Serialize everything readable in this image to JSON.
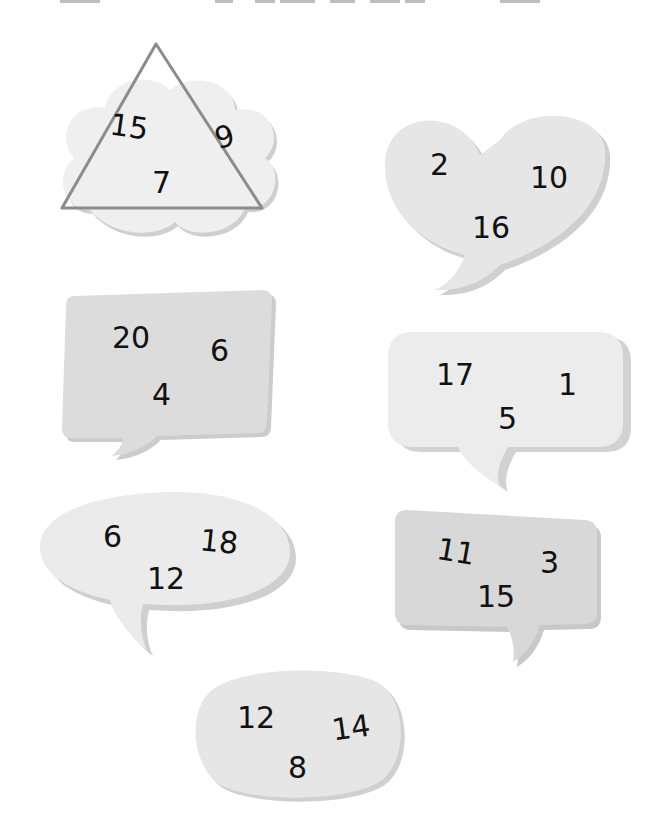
{
  "colors": {
    "bubble_fill_light": "#eeeeee",
    "bubble_fill_mid": "#e4e4e4",
    "bubble_fill_dark": "#d9d9d9",
    "bubble_shadow": "#cfcfcf",
    "triangle_stroke": "#8c8c8c",
    "digit": "#111111"
  },
  "shapes": [
    {
      "id": "cloud",
      "outline": "triangle",
      "numbers": [
        "15",
        "9",
        "7"
      ]
    },
    {
      "id": "heart",
      "numbers": [
        "2",
        "10",
        "16"
      ]
    },
    {
      "id": "square-speech",
      "numbers": [
        "20",
        "6",
        "4"
      ]
    },
    {
      "id": "rounded-speech",
      "numbers": [
        "17",
        "1",
        "5"
      ]
    },
    {
      "id": "oval-speech",
      "numbers": [
        "6",
        "18",
        "12"
      ]
    },
    {
      "id": "tilted-speech",
      "numbers": [
        "11",
        "3",
        "15"
      ]
    },
    {
      "id": "oval",
      "numbers": [
        "12",
        "14",
        "8"
      ]
    }
  ]
}
